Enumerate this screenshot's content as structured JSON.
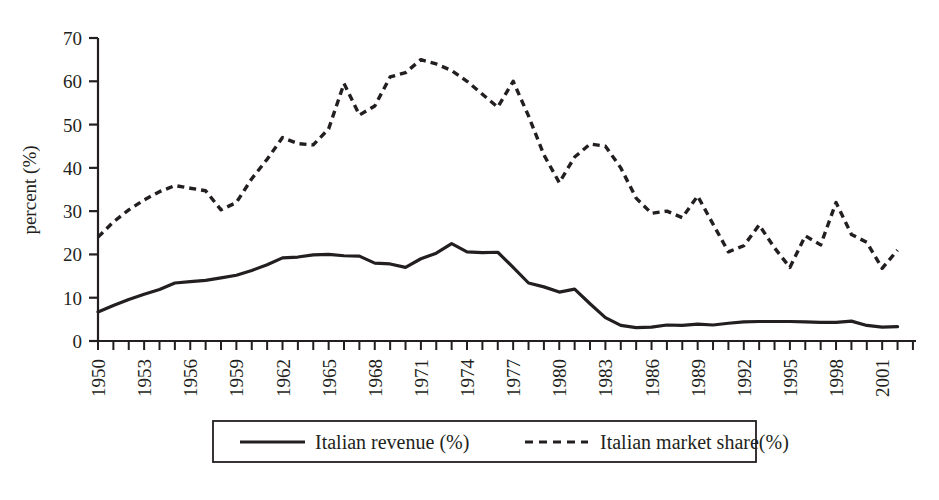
{
  "chart_data": {
    "type": "line",
    "title": "",
    "xlabel": "",
    "ylabel": "percent (%)",
    "ylim": [
      0,
      70
    ],
    "yticks": [
      0,
      10,
      20,
      30,
      40,
      50,
      60,
      70
    ],
    "xlim": [
      1950,
      2002
    ],
    "xticks_labeled": [
      1950,
      1953,
      1956,
      1959,
      1962,
      1965,
      1968,
      1971,
      1974,
      1977,
      1980,
      1983,
      1986,
      1989,
      1992,
      1995,
      1998,
      2001
    ],
    "x": [
      1950,
      1951,
      1952,
      1953,
      1954,
      1955,
      1956,
      1957,
      1958,
      1959,
      1960,
      1961,
      1962,
      1963,
      1964,
      1965,
      1966,
      1967,
      1968,
      1969,
      1970,
      1971,
      1972,
      1973,
      1974,
      1975,
      1976,
      1977,
      1978,
      1979,
      1980,
      1981,
      1982,
      1983,
      1984,
      1985,
      1986,
      1987,
      1988,
      1989,
      1990,
      1991,
      1992,
      1993,
      1994,
      1995,
      1996,
      1997,
      1998,
      1999,
      2000,
      2001,
      2002
    ],
    "grid": false,
    "legend_position": "below-axes",
    "series": [
      {
        "name": "Italian revenue (%)",
        "style": "solid",
        "color": "#231f20",
        "values": [
          6.7,
          8.2,
          9.6,
          10.8,
          11.9,
          13.4,
          13.7,
          14.0,
          14.6,
          15.2,
          16.3,
          17.6,
          19.2,
          19.4,
          19.9,
          20.0,
          19.7,
          19.6,
          18.0,
          17.8,
          17.0,
          19.0,
          20.3,
          22.5,
          20.6,
          20.4,
          20.5,
          17.0,
          13.4,
          12.5,
          11.3,
          12.0,
          8.6,
          5.4,
          3.6,
          3.1,
          3.2,
          3.7,
          3.6,
          3.9,
          3.7,
          4.1,
          4.4,
          4.5,
          4.5,
          4.5,
          4.4,
          4.3,
          4.3,
          4.6,
          3.6,
          3.2,
          3.3
        ]
      },
      {
        "name": "Italian market share(%)",
        "style": "dashed",
        "color": "#231f20",
        "values": [
          24.0,
          27.5,
          30.3,
          32.6,
          34.5,
          35.9,
          35.3,
          34.7,
          30.3,
          32.0,
          37.5,
          42.0,
          47.0,
          45.6,
          45.3,
          49.0,
          59.5,
          52.2,
          54.3,
          61.0,
          62.0,
          65.0,
          64.0,
          62.5,
          60.0,
          57.0,
          54.0,
          60.0,
          52.0,
          43.0,
          36.6,
          42.5,
          45.5,
          45.0,
          40.0,
          33.0,
          29.5,
          30.0,
          28.5,
          33.5,
          27.0,
          20.6,
          22.0,
          26.8,
          21.5,
          17.0,
          24.3,
          22.2,
          32.0,
          24.6,
          22.8,
          16.8,
          21.0
        ]
      }
    ]
  },
  "axis": {
    "y_label": "percent (%)",
    "y_tick_labels": [
      "0",
      "10",
      "20",
      "30",
      "40",
      "50",
      "60",
      "70"
    ],
    "x_tick_labels": [
      "1950",
      "1953",
      "1956",
      "1959",
      "1962",
      "1965",
      "1968",
      "1971",
      "1974",
      "1977",
      "1980",
      "1983",
      "1986",
      "1989",
      "1992",
      "1995",
      "1998",
      "2001"
    ]
  },
  "legend": {
    "entries": [
      {
        "label": "Italian revenue (%)",
        "style": "solid"
      },
      {
        "label": "Italian market share(%)",
        "style": "dashed"
      }
    ]
  }
}
